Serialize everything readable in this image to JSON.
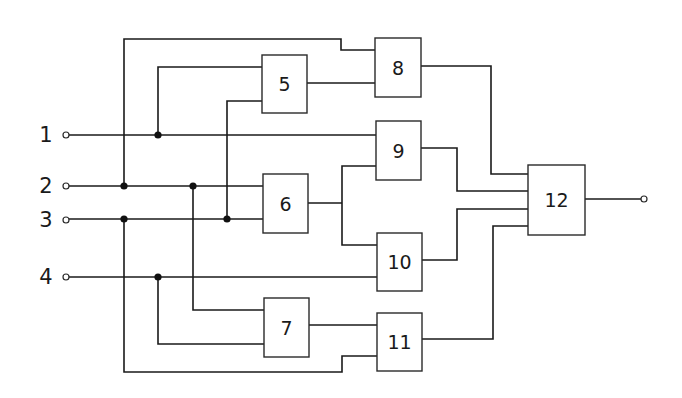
{
  "diagram": {
    "inputs": [
      {
        "id": "1",
        "label": "1"
      },
      {
        "id": "2",
        "label": "2"
      },
      {
        "id": "3",
        "label": "3"
      },
      {
        "id": "4",
        "label": "4"
      }
    ],
    "blocks": [
      {
        "id": "5",
        "label": "5"
      },
      {
        "id": "6",
        "label": "6"
      },
      {
        "id": "7",
        "label": "7"
      },
      {
        "id": "8",
        "label": "8"
      },
      {
        "id": "9",
        "label": "9"
      },
      {
        "id": "10",
        "label": "10"
      },
      {
        "id": "11",
        "label": "11"
      },
      {
        "id": "12",
        "label": "12"
      }
    ],
    "connections": [
      {
        "from": "2",
        "to": "8"
      },
      {
        "from": "5",
        "to": "8"
      },
      {
        "from": "1",
        "to": "5"
      },
      {
        "from": "3",
        "to": "5"
      },
      {
        "from": "1",
        "to": "9"
      },
      {
        "from": "6",
        "to": "9"
      },
      {
        "from": "2",
        "to": "6"
      },
      {
        "from": "3",
        "to": "6"
      },
      {
        "from": "6",
        "to": "10"
      },
      {
        "from": "4",
        "to": "10"
      },
      {
        "from": "2",
        "to": "7"
      },
      {
        "from": "4",
        "to": "7"
      },
      {
        "from": "7",
        "to": "11"
      },
      {
        "from": "3",
        "to": "11"
      },
      {
        "from": "8",
        "to": "12"
      },
      {
        "from": "9",
        "to": "12"
      },
      {
        "from": "10",
        "to": "12"
      },
      {
        "from": "11",
        "to": "12"
      }
    ],
    "output": {
      "from": "12",
      "label": ""
    },
    "colors": {
      "line": "#1a1a1a",
      "background": "#ffffff"
    }
  }
}
